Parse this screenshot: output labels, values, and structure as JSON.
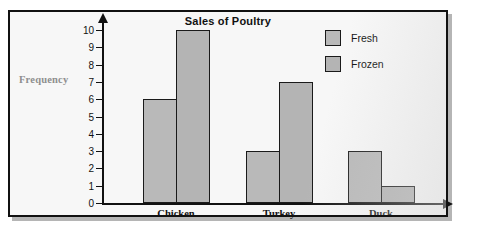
{
  "chart_data": {
    "type": "bar",
    "title": "Sales of Poultry",
    "xlabel": "",
    "ylabel": "Frequency",
    "categories": [
      "Chicken",
      "Turkey",
      "Duck"
    ],
    "series": [
      {
        "name": "Fresh",
        "values": [
          6,
          3,
          3
        ]
      },
      {
        "name": "Frozen",
        "values": [
          10,
          7,
          1
        ]
      }
    ],
    "ylim": [
      0,
      10
    ],
    "yticks": [
      0,
      1,
      2,
      3,
      4,
      5,
      6,
      7,
      8,
      9,
      10
    ],
    "ytick_labels": [
      "0",
      "1",
      "2",
      "3",
      "4",
      "5",
      "6",
      "7",
      "8",
      "9",
      "10"
    ],
    "grid": false,
    "legend_position": "top-right",
    "colors": {
      "fresh": "#b9b9b9",
      "frozen": "#b4b4b4",
      "outline": "#1a1a1a",
      "axis": "#111111",
      "ylabel_text": "#8e8e8e",
      "background": "#f7f7f7"
    }
  },
  "legend": {
    "items": [
      {
        "label": "Fresh"
      },
      {
        "label": "Frozen"
      }
    ]
  }
}
